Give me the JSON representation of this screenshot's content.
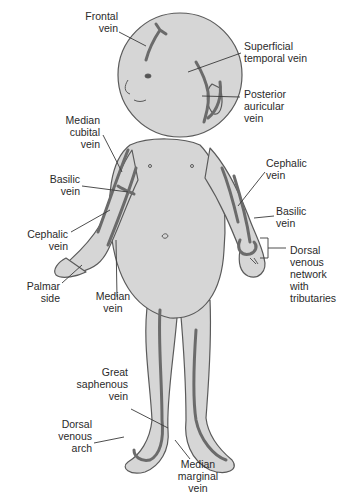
{
  "diagram": {
    "colors": {
      "skin": "#d6d6d6",
      "skin_shade": "#bdbdbd",
      "outline": "#5a5a5a",
      "vein": "#6b6b6b",
      "leader": "#3a3a3a",
      "text": "#2a2a2a"
    },
    "labels": {
      "frontal_vein": "Frontal\nvein",
      "superficial_temporal_vein": "Superficial\ntemporal vein",
      "posterior_auricular_vein": "Posterior\nauricular\nvein",
      "median_cubital_vein": "Median\ncubital\nvein",
      "basilic_vein_left": "Basilic\nvein",
      "cephalic_vein_left": "Cephalic\nvein",
      "palmar_side": "Palmar\nside",
      "median_vein": "Median\nvein",
      "cephalic_vein_right": "Cephalic\nvein",
      "basilic_vein_right": "Basilic\nvein",
      "dorsal_venous_network": "Dorsal\nvenous\nnetwork\nwith\ntributaries",
      "great_saphenous_vein": "Great\nsaphenous\nvein",
      "dorsal_venous_arch": "Dorsal\nvenous\narch",
      "median_marginal_vein": "Median\nmarginal\nvein"
    }
  }
}
